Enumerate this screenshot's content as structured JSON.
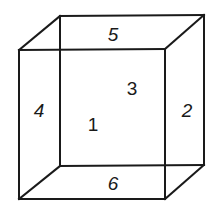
{
  "diagram": {
    "type": "wireframe-cube",
    "stroke_color": "#1a1a1a",
    "background": "#ffffff",
    "vertices": {
      "back_top_left": [
        60,
        16
      ],
      "back_top_right": [
        204,
        15
      ],
      "back_bottom_left": [
        60,
        166
      ],
      "back_bottom_right": [
        204,
        165
      ],
      "front_top_left": [
        19,
        50
      ],
      "front_top_right": [
        165,
        49
      ],
      "front_bottom_left": [
        19,
        199
      ],
      "front_bottom_right": [
        165,
        199
      ]
    },
    "faces": [
      {
        "id": "front",
        "label": "1",
        "pos": [
          93,
          123
        ],
        "size": 18,
        "italic": false
      },
      {
        "id": "right",
        "label": "2",
        "pos": [
          187,
          110
        ],
        "size": 18,
        "italic": true
      },
      {
        "id": "back",
        "label": "3",
        "pos": [
          132,
          88
        ],
        "size": 18,
        "italic": false
      },
      {
        "id": "left",
        "label": "4",
        "pos": [
          39,
          110
        ],
        "size": 18,
        "italic": true
      },
      {
        "id": "top",
        "label": "5",
        "pos": [
          113,
          34
        ],
        "size": 18,
        "italic": true
      },
      {
        "id": "bottom",
        "label": "6",
        "pos": [
          113,
          183
        ],
        "size": 18,
        "italic": true
      }
    ]
  }
}
